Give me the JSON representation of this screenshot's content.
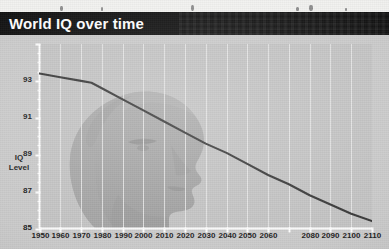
{
  "title": "World IQ over time",
  "chart_data": {
    "type": "line",
    "title": "World IQ over time",
    "xlabel": "",
    "ylabel": "IQ Level",
    "ylabel_lines": [
      "IQ",
      "Level"
    ],
    "xlim": [
      1950,
      2110
    ],
    "ylim": [
      83,
      93
    ],
    "yticks": [
      93,
      91,
      89,
      87,
      85,
      83
    ],
    "ytick_labels": [
      "93",
      "91",
      "89",
      "87",
      "85",
      "83"
    ],
    "xticks": [
      1950,
      1960,
      1970,
      1980,
      1990,
      2000,
      2010,
      2020,
      2030,
      2040,
      2050,
      2060,
      2070,
      2080,
      2090,
      2100,
      2110
    ],
    "xtick_labels": [
      "1950",
      "1960",
      "1970",
      "1980",
      "1990",
      "2000",
      "2010",
      "2020",
      "2030",
      "2040",
      "2050",
      "2060",
      "",
      "2080",
      "2090",
      "2100",
      "2110"
    ],
    "grid": "vertical",
    "legend": "none",
    "minor_ytick_step": 0.5,
    "series": [
      {
        "name": "World IQ",
        "color": "#3a3a3a",
        "x": [
          1950,
          1960,
          1970,
          1975,
          1980,
          1990,
          2000,
          2010,
          2020,
          2030,
          2040,
          2050,
          2060,
          2070,
          2080,
          2090,
          2100,
          2110
        ],
        "values": [
          91.4,
          91.2,
          91.0,
          90.9,
          90.6,
          90.0,
          89.4,
          88.8,
          88.2,
          87.6,
          87.1,
          86.5,
          85.9,
          85.4,
          84.8,
          84.3,
          83.8,
          83.4
        ]
      }
    ],
    "watermark": "human-head-profile-silhouette"
  },
  "colors": {
    "title_bar": "#121212",
    "title_text": "#ffffff",
    "plot_background": "#c4c4c4",
    "page_background": "#cbcbcb",
    "axis": "#ffffff",
    "gridline": "#e8e8e8",
    "line": "#3a3a3a",
    "text": "#1c1c1c"
  }
}
